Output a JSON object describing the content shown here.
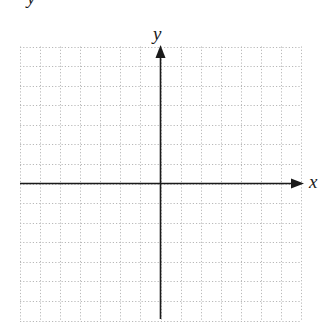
{
  "figure": {
    "type": "coordinate-plane",
    "stray_label": "y",
    "x_axis_label": "x",
    "y_axis_label": "y",
    "grid": {
      "columns": 14,
      "rows": 14,
      "style": "dotted",
      "line_color": "#b8b8b8"
    },
    "axis_color": "#1a1a1a",
    "origin_column": 7,
    "origin_row": 7
  }
}
